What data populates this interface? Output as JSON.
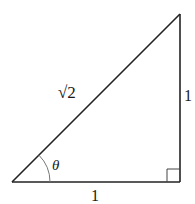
{
  "diagram": {
    "type": "right-triangle",
    "hypotenuse_label": "√2",
    "vertical_side_label": "1",
    "horizontal_side_label": "1",
    "angle_label": "θ",
    "right_angle_marker": true,
    "stroke_color": "#222222",
    "arc_color": "#777777"
  }
}
